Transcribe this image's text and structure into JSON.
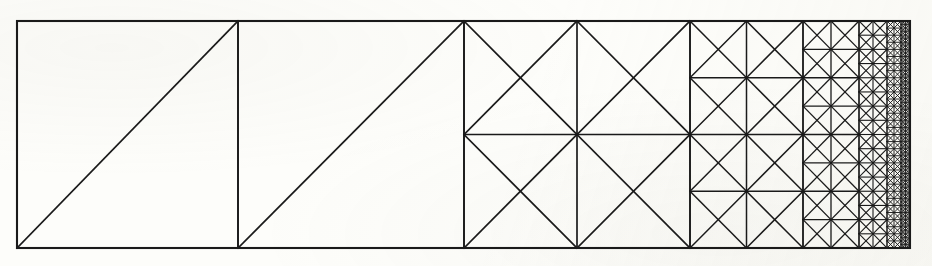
{
  "figure": {
    "element_motif": "crossed-square (four triangles per square)",
    "background_color": "#fdfdfa",
    "line_color": "#1a1a1a",
    "canvas": {
      "width": 932,
      "height": 266
    }
  },
  "mesh": {
    "domain": {
      "x0": 17,
      "y0": 21,
      "x1": 910,
      "y1": 248,
      "width": 893,
      "height": 227
    },
    "outer_border_width": 2.1,
    "refinement_direction": "right",
    "refinement_ratio": 0.5,
    "levels": [
      {
        "index": 0,
        "x_start": 17,
        "x_end": 238,
        "cell_size": 221.0,
        "columns": 1,
        "rows": 1,
        "pattern": "single-diagonal",
        "diagonal": "anti",
        "line_width": 1.7
      },
      {
        "index": 1,
        "x_start": 238,
        "x_end": 464,
        "cell_size": 226.0,
        "columns": 1,
        "rows": 1,
        "pattern": "single-diagonal",
        "diagonal": "anti",
        "line_width": 1.7
      },
      {
        "index": 2,
        "x_start": 464,
        "x_end": 690,
        "cell_size": 113.5,
        "columns": 2,
        "rows": 2,
        "pattern": "crossed-square",
        "line_width": 1.7
      },
      {
        "index": 3,
        "x_start": 690,
        "x_end": 803,
        "cell_size": 56.75,
        "columns": 2,
        "rows": 4,
        "pattern": "crossed-square",
        "line_width": 1.5
      },
      {
        "index": 4,
        "x_start": 803,
        "x_end": 859,
        "cell_size": 28.4,
        "columns": 2,
        "rows": 8,
        "pattern": "crossed-square",
        "line_width": 1.3
      },
      {
        "index": 5,
        "x_start": 859,
        "x_end": 887,
        "cell_size": 14.2,
        "columns": 2,
        "rows": 16,
        "pattern": "crossed-square",
        "line_width": 1.1
      },
      {
        "index": 6,
        "x_start": 887,
        "x_end": 901,
        "cell_size": 7.1,
        "columns": 2,
        "rows": 32,
        "pattern": "crossed-square",
        "line_width": 0.95
      },
      {
        "index": 7,
        "x_start": 901,
        "x_end": 910,
        "cell_size": 3.55,
        "columns": 2,
        "rows": 64,
        "pattern": "crossed-square",
        "line_width": 0.9
      }
    ],
    "totals": {
      "level_count": 8,
      "finest_cell_size": 3.55,
      "coarsest_cell_size": 226.0
    }
  }
}
